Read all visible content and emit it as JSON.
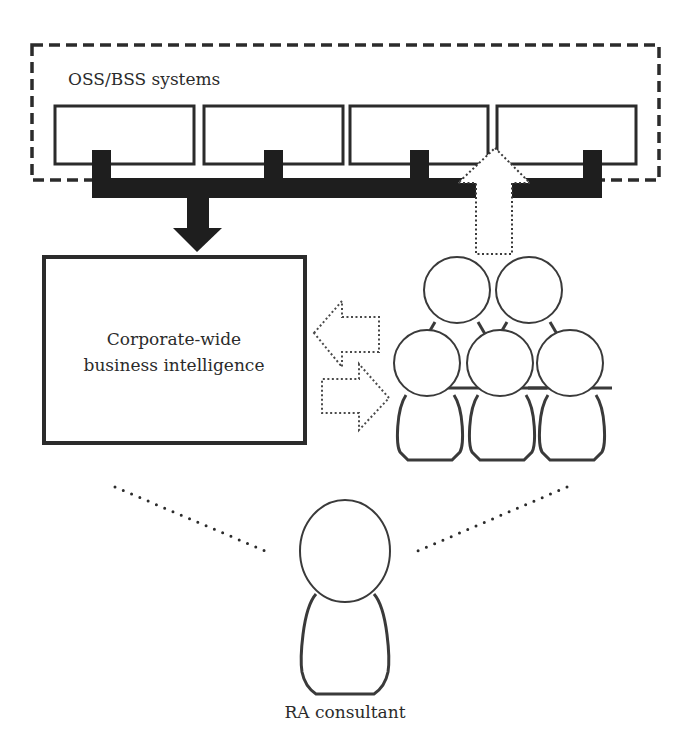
{
  "diagram": {
    "systems_group": {
      "label": "OSS/BSS systems",
      "boxes": [
        "system-1",
        "system-2",
        "system-3",
        "system-4"
      ]
    },
    "bi_box": {
      "line1": "Corporate-wide",
      "line2": "business intelligence"
    },
    "team": {
      "member_count": 5
    },
    "consultant": {
      "label": "RA consultant"
    },
    "colors": {
      "stroke": "#2b2b2b",
      "fill": "#ffffff",
      "bar": "#1e1e1e"
    }
  }
}
